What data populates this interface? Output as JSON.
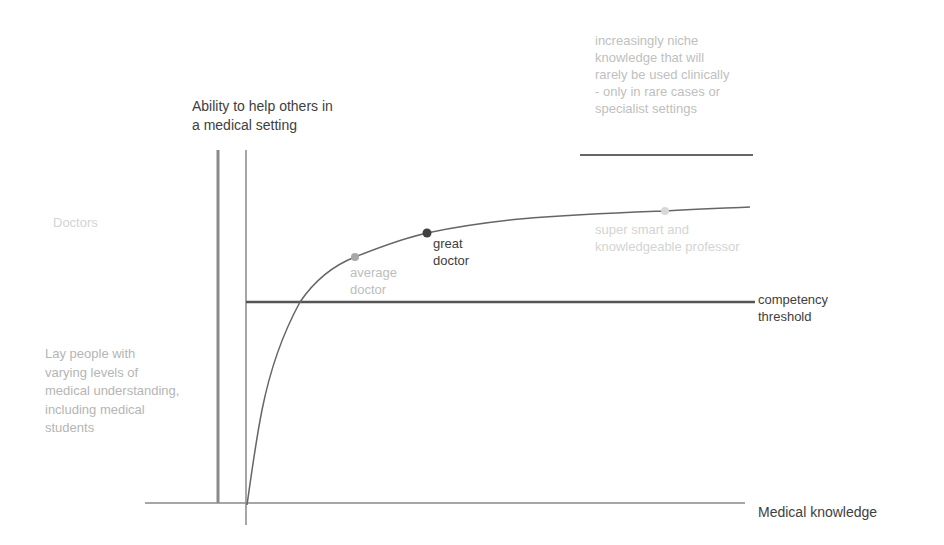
{
  "diagram": {
    "y_axis_label": "Ability to help others in\na medical setting",
    "x_axis_label": "Medical knowledge",
    "left_labels": {
      "doctors": "Doctors",
      "lay_people": "Lay people with\nvarying levels of\nmedical understanding,\nincluding medical\nstudents"
    },
    "threshold_label": "competency\nthreshold",
    "niche_note": "increasingly niche\nknowledge that will\nrarely be used clinically\n- only in rare cases or\nspecialist settings",
    "points": [
      {
        "name": "average-doctor",
        "label": "average\ndoctor",
        "color": "#a8a8a8"
      },
      {
        "name": "great-doctor",
        "label": "great\ndoctor",
        "color": "#404040"
      },
      {
        "name": "professor",
        "label": "super smart and\nknowledgeable professor",
        "color": "#d0d0d0"
      }
    ],
    "colors": {
      "axis": "#555555",
      "curve": "#666666",
      "threshold": "#555555",
      "text_dark": "#404040",
      "text_light": "#b5b5b5"
    }
  }
}
